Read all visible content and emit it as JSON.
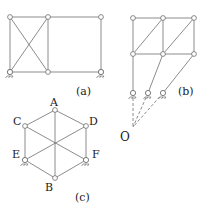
{
  "colors": {
    "line": "#6e6e6e",
    "node_fill": "#ffffff",
    "text": "#222222",
    "bg": "#ffffff"
  },
  "figures": {
    "a": {
      "caption": "(a)",
      "nodes": [
        [
          10,
          17
        ],
        [
          48,
          17
        ],
        [
          101,
          17
        ],
        [
          10,
          72
        ],
        [
          48,
          72
        ],
        [
          101,
          72
        ]
      ],
      "members": [
        [
          0,
          1
        ],
        [
          1,
          2
        ],
        [
          3,
          4
        ],
        [
          4,
          5
        ],
        [
          0,
          3
        ],
        [
          1,
          4
        ],
        [
          2,
          5
        ],
        [
          0,
          4
        ],
        [
          1,
          3
        ]
      ],
      "supports": [
        [
          10,
          72
        ],
        [
          101,
          72
        ]
      ]
    },
    "b": {
      "caption": "(b)",
      "nodes": [
        [
          133,
          18
        ],
        [
          163,
          18
        ],
        [
          194,
          18
        ],
        [
          133,
          54
        ],
        [
          163,
          54
        ],
        [
          194,
          54
        ],
        [
          133,
          93
        ],
        [
          148,
          93
        ],
        [
          163,
          93
        ]
      ],
      "members": [
        [
          0,
          1
        ],
        [
          1,
          2
        ],
        [
          3,
          4
        ],
        [
          4,
          5
        ],
        [
          0,
          3
        ],
        [
          1,
          4
        ],
        [
          2,
          5
        ],
        [
          3,
          1
        ],
        [
          4,
          2
        ],
        [
          3,
          6
        ],
        [
          4,
          7
        ],
        [
          5,
          8
        ]
      ],
      "supports": [
        [
          133,
          93
        ],
        [
          148,
          93
        ],
        [
          163,
          93
        ]
      ],
      "pole": {
        "label": "O",
        "x": 133,
        "y": 127
      }
    },
    "c": {
      "caption": "(c)",
      "vertices": {
        "A": [
          55,
          110
        ],
        "D": [
          86,
          126
        ],
        "F": [
          86,
          160
        ],
        "B": [
          55,
          178
        ],
        "E": [
          25,
          160
        ],
        "C": [
          25,
          126
        ]
      },
      "vertex_labels": [
        "A",
        "C",
        "D",
        "E",
        "F",
        "B"
      ],
      "center": [
        55,
        143
      ],
      "supports": [
        "E",
        "F"
      ]
    }
  }
}
